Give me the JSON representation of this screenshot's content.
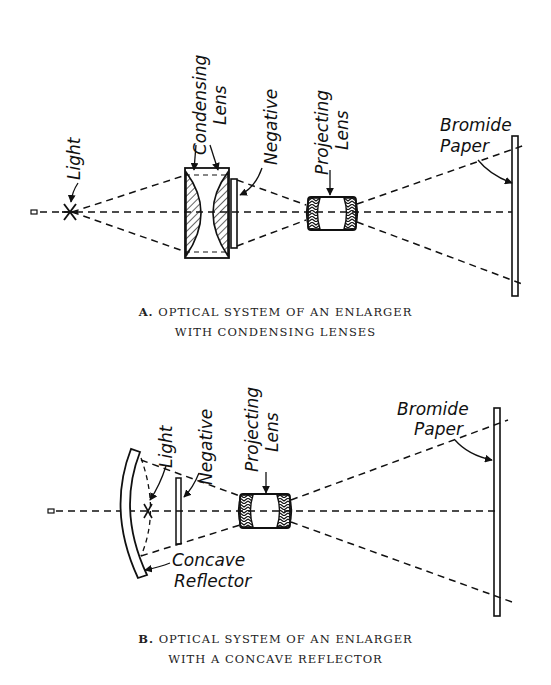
{
  "diagram_a": {
    "labels": {
      "light": "Light",
      "condensing_lens_1": "Condensing",
      "condensing_lens_2": "Lens",
      "negative": "Negative",
      "projecting_lens_1": "Projecting",
      "projecting_lens_2": "Lens",
      "bromide_paper_1": "Bromide",
      "bromide_paper_2": "Paper"
    },
    "caption": {
      "letter": "A.",
      "line1": "OPTICAL SYSTEM OF AN ENLARGER",
      "line2": "WITH CONDENSING LENSES"
    }
  },
  "diagram_b": {
    "labels": {
      "light": "Light",
      "negative": "Negative",
      "projecting_lens_1": "Projecting",
      "projecting_lens_2": "Lens",
      "bromide_paper_1": "Bromide",
      "bromide_paper_2": "Paper",
      "concave_reflector_1": "Concave",
      "concave_reflector_2": "Reflector"
    },
    "caption": {
      "letter": "B.",
      "line1": "OPTICAL SYSTEM OF AN ENLARGER",
      "line2": "WITH A CONCAVE REFLECTOR"
    }
  },
  "colors": {
    "ink": "#111111",
    "background": "#ffffff"
  }
}
